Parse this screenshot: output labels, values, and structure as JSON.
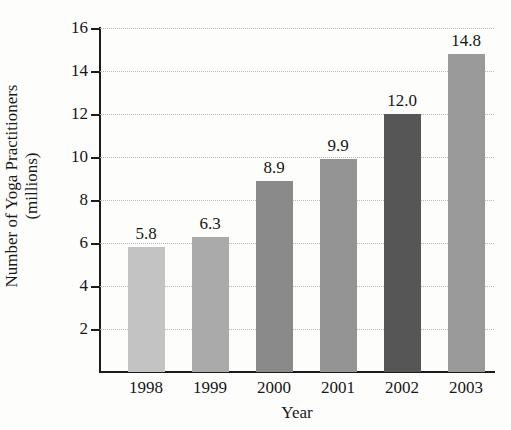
{
  "chart_data": {
    "type": "bar",
    "title": "",
    "xlabel": "Year",
    "ylabel": "Number of Yoga Practitioners (millions)",
    "ylabel_line1": "Number of Yoga Practitioners",
    "ylabel_line2": "(millions)",
    "categories": [
      "1998",
      "1999",
      "2000",
      "2001",
      "2002",
      "2003"
    ],
    "values": [
      5.8,
      6.3,
      8.9,
      9.9,
      12.0,
      14.8
    ],
    "value_labels": [
      "5.8",
      "6.3",
      "8.9",
      "9.9",
      "12.0",
      "14.8"
    ],
    "bar_colors": [
      "#c3c3c3",
      "#aaaaaa",
      "#8a8a8a",
      "#949494",
      "#565656",
      "#9a9a9a"
    ],
    "ylim": [
      0,
      16
    ],
    "ytick_labels": [
      "2",
      "4",
      "6",
      "8",
      "10",
      "12",
      "14",
      "16"
    ],
    "ytick_values": [
      2,
      4,
      6,
      8,
      10,
      12,
      14,
      16
    ],
    "grid": true,
    "grid_color": "#b9b9b9",
    "legend": "none",
    "axis_color": "#1b1b1b",
    "background": "#fdfdfc"
  }
}
